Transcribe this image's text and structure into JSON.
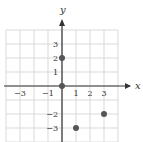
{
  "chart_data": {
    "type": "scatter",
    "title": "",
    "xlabel": "x",
    "ylabel": "y",
    "xlim": [
      -4,
      4
    ],
    "ylim": [
      -4,
      4
    ],
    "grid": true,
    "x_tick_labels": [
      "-3",
      "-1",
      "1",
      "2",
      "3"
    ],
    "y_tick_labels": [
      "3",
      "2",
      "1",
      "-2",
      "-3"
    ],
    "x_ticks": [
      -3,
      -1,
      1,
      2,
      3
    ],
    "y_ticks": [
      3,
      2,
      1,
      -2,
      -3
    ],
    "series": [
      {
        "name": "points",
        "points": [
          {
            "x": 0,
            "y": 2
          },
          {
            "x": 0,
            "y": 0
          },
          {
            "x": 1,
            "y": -3
          },
          {
            "x": 3,
            "y": -2
          }
        ]
      }
    ],
    "colors": {
      "grid": "#d9d9d9",
      "axis": "#333333",
      "point": "#555555"
    }
  }
}
